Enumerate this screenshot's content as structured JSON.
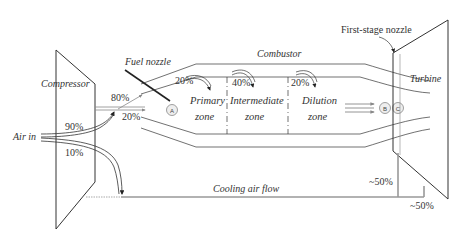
{
  "diagram": {
    "type": "gas-turbine-airflow-schematic",
    "components": {
      "compressor": "Compressor",
      "combustor": "Combustor",
      "turbine": "Turbine",
      "fuel_nozzle": "Fuel nozzle",
      "first_stage_nozzle": "First-stage nozzle"
    },
    "inlet_label": "Air in",
    "splits": {
      "to_combustor": "90%",
      "to_cooling": "10%",
      "combustor_outer": "80%",
      "combustor_inner": "20%"
    },
    "zones": [
      {
        "name_line1": "Primary",
        "name_line2": "zone",
        "air_pct": "20%"
      },
      {
        "name_line1": "Intermediate",
        "name_line2": "zone",
        "air_pct": "40%"
      },
      {
        "name_line1": "Dilution",
        "name_line2": "zone",
        "air_pct": "20%"
      }
    ],
    "stations": [
      "A",
      "B",
      "C"
    ],
    "cooling": {
      "label": "Cooling air flow",
      "split_1": "~50%",
      "split_2": "~50%"
    }
  }
}
